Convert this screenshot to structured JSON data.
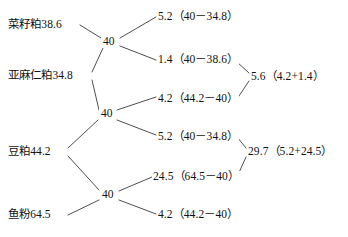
{
  "diagram": {
    "type": "pearson-square-feed-formulation",
    "target_protein": "40",
    "ingredients": [
      {
        "id": "rapeseed-meal",
        "name": "菜籽粕",
        "value": "38.6",
        "label": "菜籽粕38.6"
      },
      {
        "id": "linseed-meal",
        "name": "亚麻仁粕",
        "value": "34.8",
        "label": "亚麻仁粕34.8"
      },
      {
        "id": "soybean-meal",
        "name": "豆粕",
        "value": "44.2",
        "label": "豆粕44.2"
      },
      {
        "id": "fish-meal",
        "name": "鱼粉",
        "value": "64.5",
        "label": "鱼粉64.5"
      }
    ],
    "centers": [
      {
        "id": "center-top",
        "label": "40"
      },
      {
        "id": "center-middle",
        "label": "40"
      },
      {
        "id": "center-bottom",
        "label": "40"
      }
    ],
    "differences": [
      {
        "id": "diff-1",
        "value": "5.2",
        "expression": "（40－34.8）",
        "label": "5.2（40－34.8）"
      },
      {
        "id": "diff-2",
        "value": "1.4",
        "expression": "（40－38.6）",
        "label": "1.4（40－38.6）"
      },
      {
        "id": "diff-3",
        "value": "4.2",
        "expression": "（44.2－40）",
        "label": "4.2（44.2－40）"
      },
      {
        "id": "diff-4",
        "value": "5.2",
        "expression": "（40－34.8）",
        "label": "5.2（40－34.8）"
      },
      {
        "id": "diff-5",
        "value": "24.5",
        "expression": "（64.5－40）",
        "label": "24.5（64.5－40）"
      },
      {
        "id": "diff-6",
        "value": "4.2",
        "expression": "（44.2－40）",
        "label": "4.2（44.2－40）"
      }
    ],
    "sums": [
      {
        "id": "sum-top",
        "value": "5.6",
        "expression": "（4.2+1.4）",
        "label": "5.6（4.2+1.4）"
      },
      {
        "id": "sum-bottom",
        "value": "29.7",
        "expression": "（5.2+24.5）",
        "label": "29.7（5.2+24.5）"
      }
    ],
    "colors": {
      "line": "#3a3a3a",
      "text": "#111111",
      "background": "#ffffff"
    }
  }
}
